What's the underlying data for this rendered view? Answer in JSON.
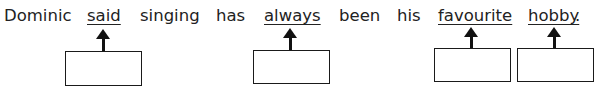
{
  "sentence": {
    "words": [
      {
        "text": "Dominic",
        "underlined": false
      },
      {
        "text": "said",
        "underlined": true
      },
      {
        "text": "singing",
        "underlined": false
      },
      {
        "text": "has",
        "underlined": false
      },
      {
        "text": "always",
        "underlined": true
      },
      {
        "text": "been",
        "underlined": false
      },
      {
        "text": "his",
        "underlined": false
      },
      {
        "text": "favourite",
        "underlined": true
      },
      {
        "text": "hobby",
        "underlined": true
      },
      {
        "text": ".",
        "underlined": false
      }
    ]
  },
  "answer_boxes": [
    {
      "for_word": "said",
      "value": ""
    },
    {
      "for_word": "always",
      "value": ""
    },
    {
      "for_word": "favourite",
      "value": ""
    },
    {
      "for_word": "hobby",
      "value": ""
    }
  ]
}
